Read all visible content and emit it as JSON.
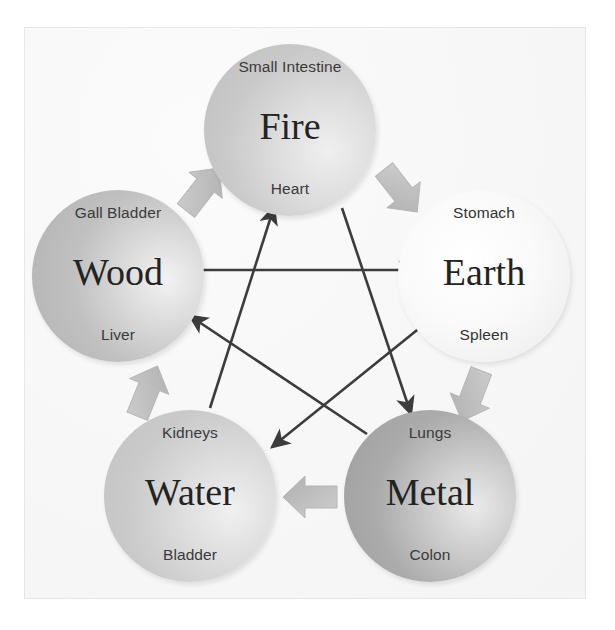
{
  "diagram": {
    "background_color": "#f7f7f7",
    "nodes": [
      {
        "id": "fire",
        "element": "Fire",
        "organ_top": "Small Intestine",
        "organ_bottom": "Heart",
        "position": "top",
        "fill": "#c9c9c9"
      },
      {
        "id": "wood",
        "element": "Wood",
        "organ_top": "Gall Bladder",
        "organ_bottom": "Liver",
        "position": "left",
        "fill": "#c0c0c0"
      },
      {
        "id": "earth",
        "element": "Earth",
        "organ_top": "Stomach",
        "organ_bottom": "Spleen",
        "position": "right",
        "fill": "#f5f5f5"
      },
      {
        "id": "water",
        "element": "Water",
        "organ_top": "Kidneys",
        "organ_bottom": "Bladder",
        "position": "bottom-left",
        "fill": "#cacaca"
      },
      {
        "id": "metal",
        "element": "Metal",
        "organ_top": "Lungs",
        "organ_bottom": "Colon",
        "position": "bottom-right",
        "fill": "#ababab"
      }
    ],
    "generating_cycle": {
      "style": "thick-block-arrow",
      "color": "#bdbdbd",
      "edges": [
        {
          "from": "wood",
          "to": "fire"
        },
        {
          "from": "fire",
          "to": "earth"
        },
        {
          "from": "earth",
          "to": "metal"
        },
        {
          "from": "metal",
          "to": "water"
        },
        {
          "from": "water",
          "to": "wood"
        }
      ]
    },
    "controlling_cycle": {
      "style": "thin-line-arrow",
      "color": "#3c3c3c",
      "edges": [
        {
          "from": "wood",
          "to": "earth"
        },
        {
          "from": "earth",
          "to": "water"
        },
        {
          "from": "water",
          "to": "fire"
        },
        {
          "from": "fire",
          "to": "metal"
        },
        {
          "from": "metal",
          "to": "wood"
        }
      ]
    }
  }
}
